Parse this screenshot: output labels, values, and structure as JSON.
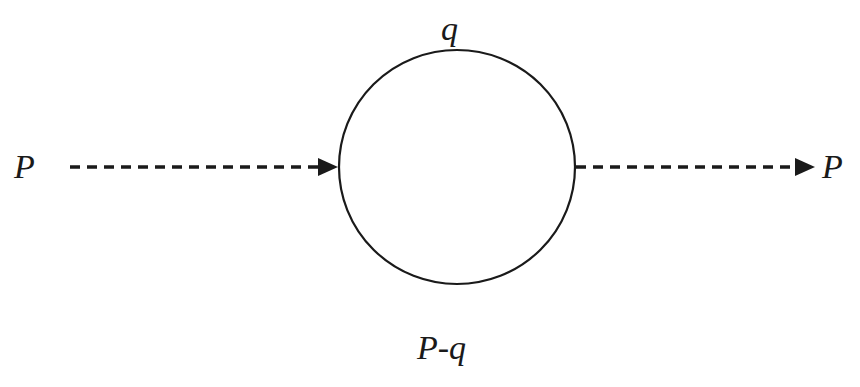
{
  "diagram": {
    "type": "feynman-loop",
    "colors": {
      "line": "#1a1a1a",
      "background": "#ffffff"
    },
    "labels": {
      "incoming": "P",
      "outgoing": "P",
      "top": "q",
      "bottom": "P-q"
    },
    "elements": {
      "incoming_line": "dashed arrow (scalar propagator) into loop",
      "outgoing_line": "dashed arrow (scalar propagator) out of loop",
      "loop": "solid circle"
    }
  }
}
